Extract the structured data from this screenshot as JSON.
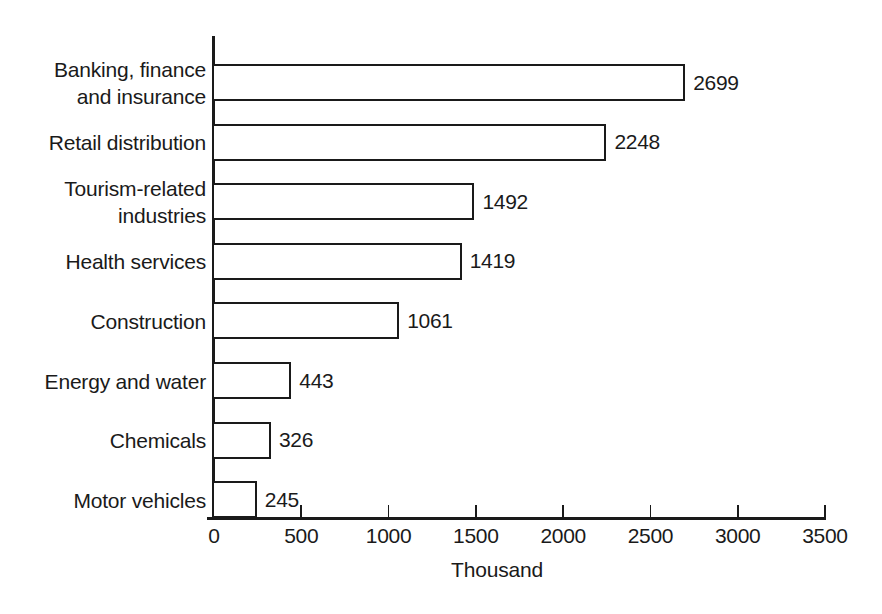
{
  "chart_data": {
    "type": "bar",
    "orientation": "horizontal",
    "title": "",
    "xlabel": "Thousand",
    "ylabel": "",
    "categories": [
      "Banking, finance\nand insurance",
      "Retail distribution",
      "Tourism-related\nindustries",
      "Health services",
      "Construction",
      "Energy and water",
      "Chemicals",
      "Motor vehicles"
    ],
    "values": [
      2699,
      2248,
      1492,
      1419,
      1061,
      443,
      326,
      245
    ],
    "value_labels": [
      "2699",
      "2248",
      "1492",
      "1419",
      "1061",
      "443",
      "326",
      "245"
    ],
    "xlim": [
      0,
      3500
    ],
    "xticks": [
      0,
      500,
      1000,
      1500,
      2000,
      2500,
      3000,
      3500
    ],
    "xtick_labels": [
      "0",
      "500",
      "1000",
      "1500",
      "2000",
      "2500",
      "3000",
      "3500"
    ],
    "grid": false,
    "legend": false,
    "bar_fill_color": "#ffffff",
    "bar_edge_color": "#1a1a1a",
    "background_color": "#ffffff"
  }
}
